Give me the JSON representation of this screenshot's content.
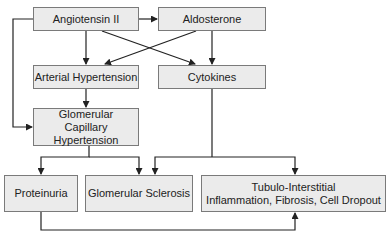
{
  "diagram": {
    "type": "flowchart",
    "nodes": {
      "angiotensin": "Angiotensin II",
      "aldosterone": "Aldosterone",
      "arterial_hypertension": "Arterial Hypertension",
      "cytokines": "Cytokines",
      "glomerular_capillary": "Glomerular Capillary Hypertension",
      "proteinuria": "Proteinuria",
      "glomerular_sclerosis": "Glomerular Sclerosis",
      "tubulo_line1": "Tubulo-Interstitial",
      "tubulo_line2": "Inflammation, Fibrosis, Cell Dropout"
    },
    "edges": [
      [
        "Angiotensin II",
        "Aldosterone"
      ],
      [
        "Angiotensin II",
        "Arterial Hypertension"
      ],
      [
        "Angiotensin II",
        "Cytokines"
      ],
      [
        "Angiotensin II",
        "Glomerular Capillary Hypertension"
      ],
      [
        "Aldosterone",
        "Arterial Hypertension"
      ],
      [
        "Aldosterone",
        "Cytokines"
      ],
      [
        "Arterial Hypertension",
        "Glomerular Capillary Hypertension"
      ],
      [
        "Glomerular Capillary Hypertension",
        "Proteinuria"
      ],
      [
        "Glomerular Capillary Hypertension",
        "Glomerular Sclerosis"
      ],
      [
        "Cytokines",
        "Glomerular Sclerosis"
      ],
      [
        "Cytokines",
        "Tubulo-Interstitial Inflammation, Fibrosis, Cell Dropout"
      ],
      [
        "Proteinuria",
        "Tubulo-Interstitial Inflammation, Fibrosis, Cell Dropout"
      ]
    ],
    "colors": {
      "box_fill": "#ebebeb",
      "box_border": "#7a7a7a",
      "line": "#222222"
    }
  }
}
